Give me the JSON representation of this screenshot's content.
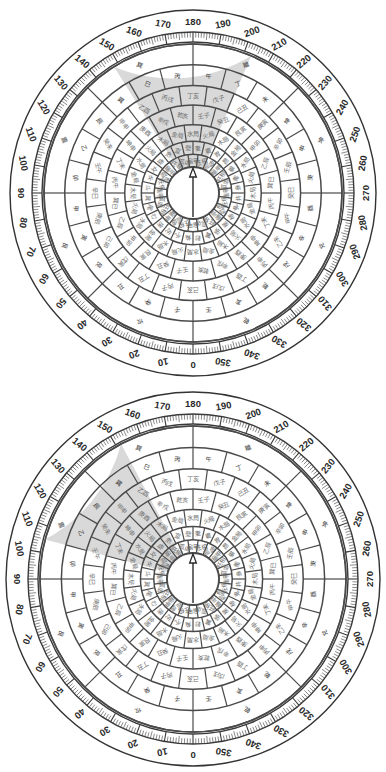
{
  "page": {
    "background_color": "#ffffff",
    "width": 386,
    "height": 772
  },
  "colors": {
    "ink": "#333333",
    "ring_line": "#4a4a4a",
    "text_dark": "#2a2a2a",
    "text_gray": "#6e6e6e",
    "highlight_fill": "#d9d9d9",
    "plate_fill": "#ffffff",
    "tick": "#3a3a3a"
  },
  "scale": {
    "name": "degree-scale",
    "unit": "degrees",
    "min": 0,
    "max": 360,
    "major_step": 10,
    "minor_step": 1,
    "zero_position": "bottom",
    "direction": "counterclockwise",
    "labels": [
      "0",
      "10",
      "20",
      "30",
      "40",
      "50",
      "60",
      "70",
      "80",
      "90",
      "100",
      "110",
      "120",
      "130",
      "140",
      "150",
      "160",
      "170",
      "180",
      "190",
      "200",
      "210",
      "220",
      "230",
      "240",
      "250",
      "260",
      "270",
      "280",
      "290",
      "300",
      "310",
      "320",
      "330",
      "340",
      "350"
    ]
  },
  "needle": {
    "name": "north-needle",
    "label": "",
    "direction": "north",
    "shape": "triangle-arrow"
  },
  "compasses": [
    {
      "id": "compass-1",
      "name": "luopan-top",
      "center": {
        "x": 193,
        "y": 193
      },
      "outer_radius": 183,
      "highlight": {
        "start_deg": 148,
        "end_deg": 203,
        "color": "#d9d9d9"
      },
      "rings": [
        {
          "index": 0,
          "name": "ring-bagua-8",
          "sectors": 8,
          "offset_deg": 0,
          "labels": [
            "坎",
            "艮",
            "震",
            "巽",
            "離",
            "坤",
            "兌",
            "乾"
          ]
        },
        {
          "index": 1,
          "name": "ring-24-mountains",
          "sectors": 24,
          "offset_deg": 0,
          "labels": [
            "子",
            "癸",
            "丑",
            "艮",
            "寅",
            "甲",
            "卯",
            "乙",
            "辰",
            "巽",
            "巳",
            "丙",
            "午",
            "丁",
            "未",
            "坤",
            "申",
            "庚",
            "酉",
            "辛",
            "戌",
            "乾",
            "亥",
            "壬"
          ]
        },
        {
          "index": 2,
          "name": "ring-24-dragons",
          "sectors": 24,
          "offset_deg": 7.5,
          "labels": [
            "丙子",
            "丁丑",
            "戊寅",
            "己卯",
            "庚辰",
            "辛巳",
            "壬午",
            "癸未",
            "甲申",
            "乙酉",
            "丙戌",
            "丁亥",
            "戊子",
            "己丑",
            "庚寅",
            "辛卯",
            "壬辰",
            "癸巳",
            "甲午",
            "乙未",
            "丙申",
            "丁酉",
            "戊戌",
            "己亥"
          ]
        },
        {
          "index": 3,
          "name": "ring-60-dragon-penetrating",
          "sectors": 24,
          "offset_deg": 0,
          "labels": [
            "壬子",
            "癸丑",
            "艮寅",
            "甲卯",
            "乙辰",
            "巽巳",
            "丙午",
            "丁未",
            "坤申",
            "庚酉",
            "辛戌",
            "乾亥",
            "壬子",
            "癸丑",
            "艮寅",
            "甲卯",
            "乙辰",
            "巽巳",
            "丙午",
            "丁未",
            "坤申",
            "庚酉",
            "辛戌",
            "乾亥"
          ]
        },
        {
          "index": 4,
          "name": "ring-human-plate",
          "sectors": 24,
          "offset_deg": 7.5,
          "labels": [
            "火局",
            "木局",
            "金局",
            "水局",
            "火局",
            "木局",
            "金局",
            "水局",
            "火局",
            "木局",
            "金局",
            "水局",
            "火局",
            "木局",
            "金局",
            "水局",
            "火局",
            "木局",
            "金局",
            "水局",
            "火局",
            "木局",
            "金局",
            "水局"
          ]
        },
        {
          "index": 5,
          "name": "ring-28-constellations",
          "sectors": 28,
          "offset_deg": 0,
          "labels": [
            "角",
            "亢",
            "氐",
            "房",
            "心",
            "尾",
            "箕",
            "斗",
            "牛",
            "女",
            "虛",
            "危",
            "室",
            "壁",
            "奎",
            "婁",
            "胃",
            "昴",
            "畢",
            "觜",
            "參",
            "井",
            "鬼",
            "柳",
            "星",
            "張",
            "翼",
            "軫"
          ]
        },
        {
          "index": 6,
          "name": "ring-120-fen-jin",
          "sectors": 24,
          "offset_deg": 7.5,
          "labels": [
            "旺相",
            "孤虛",
            "龜甲",
            "旺相",
            "孤虛",
            "龜甲",
            "旺相",
            "孤虛",
            "龜甲",
            "旺相",
            "孤虛",
            "龜甲",
            "旺相",
            "孤虛",
            "龜甲",
            "旺相",
            "孤虛",
            "龜甲",
            "旺相",
            "孤虛",
            "龜甲",
            "旺相",
            "孤虛",
            "龜甲"
          ]
        }
      ]
    },
    {
      "id": "compass-2",
      "name": "luopan-bottom",
      "center": {
        "x": 193,
        "y": 579
      },
      "outer_radius": 187,
      "highlight": {
        "start_deg": 105,
        "end_deg": 152,
        "color": "#d9d9d9"
      },
      "rings": [
        {
          "index": 0,
          "name": "ring-bagua-8",
          "sectors": 8,
          "offset_deg": 0,
          "labels": [
            "坎",
            "艮",
            "震",
            "巽",
            "離",
            "坤",
            "兌",
            "乾"
          ]
        },
        {
          "index": 1,
          "name": "ring-24-mountains",
          "sectors": 24,
          "offset_deg": 0,
          "labels": [
            "子",
            "癸",
            "丑",
            "艮",
            "寅",
            "甲",
            "卯",
            "乙",
            "辰",
            "巽",
            "巳",
            "丙",
            "午",
            "丁",
            "未",
            "坤",
            "申",
            "庚",
            "酉",
            "辛",
            "戌",
            "乾",
            "亥",
            "壬"
          ]
        },
        {
          "index": 2,
          "name": "ring-24-dragons",
          "sectors": 24,
          "offset_deg": 7.5,
          "labels": [
            "丙子",
            "丁丑",
            "戊寅",
            "己卯",
            "庚辰",
            "辛巳",
            "壬午",
            "癸未",
            "甲申",
            "乙酉",
            "丙戌",
            "丁亥",
            "戊子",
            "己丑",
            "庚寅",
            "辛卯",
            "壬辰",
            "癸巳",
            "甲午",
            "乙未",
            "丙申",
            "丁酉",
            "戊戌",
            "己亥"
          ]
        },
        {
          "index": 3,
          "name": "ring-60-dragon-penetrating",
          "sectors": 24,
          "offset_deg": 0,
          "labels": [
            "壬子",
            "癸丑",
            "艮寅",
            "甲卯",
            "乙辰",
            "巽巳",
            "丙午",
            "丁未",
            "坤申",
            "庚酉",
            "辛戌",
            "乾亥",
            "壬子",
            "癸丑",
            "艮寅",
            "甲卯",
            "乙辰",
            "巽巳",
            "丙午",
            "丁未",
            "坤申",
            "庚酉",
            "辛戌",
            "乾亥"
          ]
        },
        {
          "index": 4,
          "name": "ring-human-plate",
          "sectors": 24,
          "offset_deg": 7.5,
          "labels": [
            "火局",
            "木局",
            "金局",
            "水局",
            "火局",
            "木局",
            "金局",
            "水局",
            "火局",
            "木局",
            "金局",
            "水局",
            "火局",
            "木局",
            "金局",
            "水局",
            "火局",
            "木局",
            "金局",
            "水局",
            "火局",
            "木局",
            "金局",
            "水局"
          ]
        },
        {
          "index": 5,
          "name": "ring-28-constellations",
          "sectors": 28,
          "offset_deg": 0,
          "labels": [
            "角",
            "亢",
            "氐",
            "房",
            "心",
            "尾",
            "箕",
            "斗",
            "牛",
            "女",
            "虛",
            "危",
            "室",
            "壁",
            "奎",
            "婁",
            "胃",
            "昴",
            "畢",
            "觜",
            "參",
            "井",
            "鬼",
            "柳",
            "星",
            "張",
            "翼",
            "軫"
          ]
        },
        {
          "index": 6,
          "name": "ring-120-fen-jin",
          "sectors": 24,
          "offset_deg": 7.5,
          "labels": [
            "旺相",
            "孤虛",
            "龜甲",
            "旺相",
            "孤虛",
            "龜甲",
            "旺相",
            "孤虛",
            "龜甲",
            "旺相",
            "孤虛",
            "龜甲",
            "旺相",
            "孤虛",
            "龜甲",
            "旺相",
            "孤虛",
            "龜甲",
            "旺相",
            "孤虛",
            "龜甲",
            "旺相",
            "孤虛",
            "龜甲"
          ]
        }
      ]
    }
  ],
  "chart_data": {
    "type": "pie",
    "categories": [
      "0",
      "10",
      "20",
      "30",
      "40",
      "50",
      "60",
      "70",
      "80",
      "90",
      "100",
      "110",
      "120",
      "130",
      "140",
      "150",
      "160",
      "170",
      "180",
      "190",
      "200",
      "210",
      "220",
      "230",
      "240",
      "250",
      "260",
      "270",
      "280",
      "290",
      "300",
      "310",
      "320",
      "330",
      "340",
      "350"
    ],
    "values": [
      10,
      10,
      10,
      10,
      10,
      10,
      10,
      10,
      10,
      10,
      10,
      10,
      10,
      10,
      10,
      10,
      10,
      10,
      10,
      10,
      10,
      10,
      10,
      10,
      10,
      10,
      10,
      10,
      10,
      10,
      10,
      10,
      10,
      10,
      10,
      10
    ],
    "xlabel": "azimuth (degrees)",
    "ylabel": "",
    "ylim": [
      0,
      360
    ],
    "grid": true,
    "legend": "none"
  }
}
